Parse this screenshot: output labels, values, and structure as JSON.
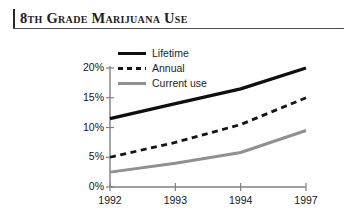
{
  "title": "8th Grade Marijuana Use",
  "legend": {
    "position": "top-center",
    "items": [
      {
        "label": "Lifetime",
        "style": "solid-thick",
        "color": "#0d0f11",
        "icon": "line-solid-icon"
      },
      {
        "label": "Annual",
        "style": "dashed",
        "color": "#131619",
        "icon": "line-dashed-icon"
      },
      {
        "label": "Current use",
        "style": "solid-gray",
        "color": "#8d9195",
        "icon": "line-solid-gray-icon"
      }
    ]
  },
  "chart_data": {
    "type": "line",
    "title": "8th Grade Marijuana Use",
    "xlabel": "",
    "ylabel": "",
    "x": [
      "1992",
      "1993",
      "1994",
      "1997"
    ],
    "categories": [
      "1992",
      "1993",
      "1994",
      "1997"
    ],
    "xtick_labels": [
      "1992",
      "1993",
      "1994",
      "1997"
    ],
    "ytick_labels": [
      "0%",
      "5%",
      "10%",
      "15%",
      "20%"
    ],
    "yticks": [
      0,
      5,
      10,
      15,
      20
    ],
    "ylim": [
      0,
      20
    ],
    "grid": false,
    "legend_position": "top-center",
    "series": [
      {
        "name": "Lifetime",
        "color": "#0d0f11",
        "style": "solid-thick",
        "values": [
          11.5,
          14.0,
          16.5,
          20.0
        ]
      },
      {
        "name": "Annual",
        "color": "#131619",
        "style": "dashed",
        "values": [
          5.0,
          7.5,
          10.5,
          15.0
        ]
      },
      {
        "name": "Current use",
        "color": "#8d9195",
        "style": "solid-gray",
        "values": [
          2.5,
          4.0,
          5.8,
          9.5
        ]
      }
    ]
  },
  "axis": {
    "y_labels": [
      "20%",
      "15%",
      "10%",
      "5%",
      "0%"
    ],
    "x_labels": [
      "1992",
      "1993",
      "1994",
      "1997"
    ]
  },
  "colors": {
    "lifetime": "#0d0f11",
    "annual": "#131619",
    "current": "#8d9195",
    "axis": "#6f7479",
    "title_rule": "#25292e"
  }
}
